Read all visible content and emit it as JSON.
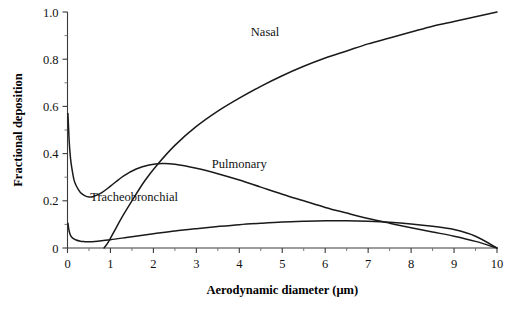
{
  "chart_data": {
    "type": "line",
    "title": "",
    "xlabel": "Aerodynamic diameter (μm)",
    "ylabel": "Fractional deposition",
    "xlim": [
      0,
      10
    ],
    "ylim": [
      0,
      1.0
    ],
    "grid": false,
    "legend_position": "inline-annotations",
    "xticks": [
      "0",
      "1",
      "2",
      "3",
      "4",
      "5",
      "6",
      "7",
      "8",
      "9",
      "10"
    ],
    "xtick_values": [
      0,
      1,
      2,
      3,
      4,
      5,
      6,
      7,
      8,
      9,
      10
    ],
    "x_minor_tick_interval": 0.5,
    "yticks": [
      "0",
      "0.2",
      "0.4",
      "0.6",
      "0.8",
      "1.0"
    ],
    "ytick_values": [
      0,
      0.2,
      0.4,
      0.6,
      0.8,
      1.0
    ],
    "y_minor_tick_interval": 0.1,
    "series": [
      {
        "name": "Nasal",
        "label_x": 4.6,
        "label_y": 0.9,
        "x": [
          0.85,
          0.95,
          1.1,
          1.3,
          1.5,
          1.8,
          2.1,
          2.5,
          3.0,
          3.5,
          4.0,
          4.5,
          5.0,
          5.5,
          6.0,
          6.5,
          7.0,
          7.5,
          8.0,
          8.5,
          9.0,
          9.5,
          10.0
        ],
        "values": [
          0.0,
          0.025,
          0.075,
          0.14,
          0.2,
          0.285,
          0.355,
          0.435,
          0.515,
          0.58,
          0.635,
          0.685,
          0.73,
          0.77,
          0.805,
          0.835,
          0.865,
          0.89,
          0.915,
          0.94,
          0.96,
          0.98,
          1.0
        ]
      },
      {
        "name": "Pulmonary",
        "label_x": 4.0,
        "label_y": 0.34,
        "x": [
          0.01,
          0.04,
          0.07,
          0.1,
          0.15,
          0.2,
          0.3,
          0.4,
          0.5,
          0.6,
          0.8,
          1.0,
          1.3,
          1.6,
          1.9,
          2.2,
          2.5,
          3.0,
          3.5,
          4.0,
          4.5,
          5.0,
          5.5,
          6.0,
          6.5,
          7.0,
          7.5,
          8.0,
          8.5,
          9.0,
          9.5,
          10.0
        ],
        "values": [
          0.57,
          0.45,
          0.38,
          0.34,
          0.29,
          0.265,
          0.235,
          0.222,
          0.216,
          0.218,
          0.235,
          0.262,
          0.305,
          0.335,
          0.352,
          0.358,
          0.355,
          0.338,
          0.315,
          0.288,
          0.258,
          0.228,
          0.2,
          0.172,
          0.148,
          0.125,
          0.105,
          0.086,
          0.068,
          0.05,
          0.028,
          0.0
        ]
      },
      {
        "name": "Tracheobronchial",
        "label_x": 1.55,
        "label_y": 0.2,
        "x": [
          0.01,
          0.04,
          0.08,
          0.12,
          0.2,
          0.3,
          0.4,
          0.5,
          0.7,
          1.0,
          1.5,
          2.0,
          2.5,
          3.0,
          3.5,
          4.0,
          4.5,
          5.0,
          5.5,
          6.0,
          6.5,
          7.0,
          7.5,
          8.0,
          8.5,
          9.0,
          9.5,
          10.0
        ],
        "values": [
          0.105,
          0.07,
          0.05,
          0.042,
          0.034,
          0.029,
          0.027,
          0.026,
          0.029,
          0.035,
          0.048,
          0.06,
          0.072,
          0.082,
          0.091,
          0.099,
          0.105,
          0.11,
          0.113,
          0.115,
          0.115,
          0.113,
          0.109,
          0.102,
          0.092,
          0.078,
          0.05,
          0.0
        ]
      }
    ]
  },
  "colors": {
    "curve": "#1a1a1a",
    "axis": "#3a3a3a",
    "background": "#ffffff"
  }
}
